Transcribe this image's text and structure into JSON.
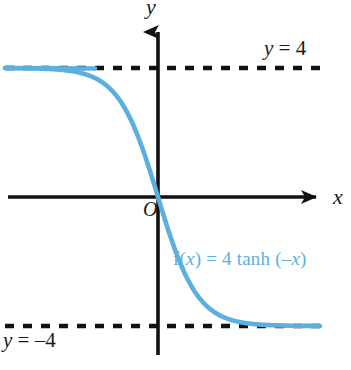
{
  "figure": {
    "background_color": "#ffffff",
    "curve_color": "#5cb0dd",
    "axis_color": "#1a1a1a"
  },
  "axes": {
    "x_label": "x",
    "y_label": "y",
    "origin_label": "O"
  },
  "annotations": {
    "asymptote_top": {
      "var": "y",
      "rest": " = 4"
    },
    "asymptote_bottom": {
      "var": "y",
      "rest": " = –4"
    },
    "function_label": {
      "fn": "f(",
      "arg1": "x",
      "mid": ") = 4 tanh (–",
      "arg2": "x",
      "close": ")"
    }
  },
  "chart_data": {
    "type": "line",
    "title": "",
    "xlabel": "x",
    "ylabel": "y",
    "grid": false,
    "legend": "none",
    "expression": "f(x) = 4 tanh(-x)",
    "xlim": [
      -5.5,
      5.5
    ],
    "ylim": [
      -5.5,
      5.5
    ],
    "asymptotes": [
      {
        "label": "y = 4",
        "value": 4,
        "style": "dashed"
      },
      {
        "label": "y = -4",
        "value": -4,
        "style": "dashed"
      }
    ],
    "series": [
      {
        "name": "f(x) = 4 tanh (-x)",
        "color": "#5cb0dd",
        "x": [
          -5.2,
          -4.8,
          -4.4,
          -4.0,
          -3.6,
          -3.2,
          -2.8,
          -2.4,
          -2.0,
          -1.6,
          -1.2,
          -0.8,
          -0.4,
          0.0,
          0.4,
          0.8,
          1.2,
          1.6,
          2.0,
          2.4,
          2.8,
          3.2,
          3.6,
          4.0,
          4.4,
          4.8,
          5.2
        ],
        "y": [
          4.0,
          4.0,
          3.999,
          3.997,
          3.994,
          3.987,
          3.971,
          3.935,
          3.857,
          3.697,
          3.395,
          2.855,
          1.898,
          0.0,
          -1.898,
          -2.855,
          -3.395,
          -3.697,
          -3.857,
          -3.935,
          -3.971,
          -3.987,
          -3.994,
          -3.997,
          -3.999,
          -4.0,
          -4.0
        ]
      }
    ]
  }
}
